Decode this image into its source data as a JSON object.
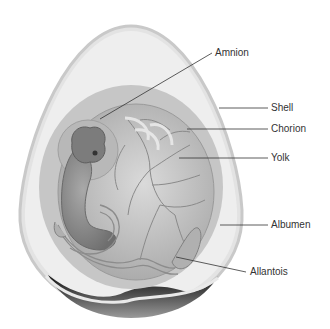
{
  "diagram": {
    "labels": [
      {
        "id": "amnion",
        "text": "Amnion"
      },
      {
        "id": "shell",
        "text": "Shell"
      },
      {
        "id": "chorion",
        "text": "Chorion"
      },
      {
        "id": "yolk",
        "text": "Yolk"
      },
      {
        "id": "albumen",
        "text": "Albumen"
      },
      {
        "id": "allantois",
        "text": "Allantois"
      }
    ],
    "colors": {
      "shell": "#d6d6d6",
      "albumen": "#ececec",
      "chorion": "#bdbdbd",
      "yolk": "#c8c8c8",
      "embryo": "#8f8f8f",
      "air_cell": "#2e2e2e",
      "leader_line": "#333333"
    }
  }
}
